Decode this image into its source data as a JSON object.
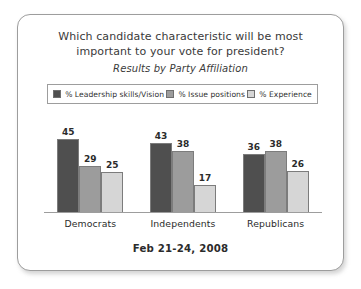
{
  "chart_data": {
    "type": "bar",
    "title_lines": [
      "Which candidate characteristic will be most",
      "important to your vote for president?"
    ],
    "subtitle": "Results by Party Affiliation",
    "categories": [
      "Democrats",
      "Independents",
      "Republicans"
    ],
    "series": [
      {
        "name": "% Leadership skills/Vision",
        "color": "#4f4f4f",
        "values": [
          45,
          43,
          36
        ]
      },
      {
        "name": "% Issue positions",
        "color": "#9c9c9c",
        "values": [
          29,
          38,
          38
        ]
      },
      {
        "name": "% Experience",
        "color": "#d6d6d6",
        "values": [
          25,
          17,
          26
        ]
      }
    ],
    "xlabel": "",
    "ylabel": "",
    "ylim": [
      0,
      52
    ],
    "grid": false,
    "legend_position": "top",
    "data_labels": true,
    "footer": "Feb 21-24, 2008"
  },
  "card": {
    "border_color": "#9d9d9d",
    "background": "#ffffff"
  }
}
